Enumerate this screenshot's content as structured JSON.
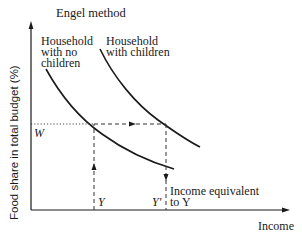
{
  "diagram": {
    "title": "Engel method",
    "y_axis_label": "Food share in total budget (%)",
    "x_axis_label": "Income",
    "curves": [
      {
        "id": "no-children",
        "label_lines": [
          "Household",
          "with no",
          "children"
        ]
      },
      {
        "id": "with-children",
        "label_lines": [
          "Household",
          "with children"
        ]
      }
    ],
    "markers": {
      "w_label": "W",
      "y_label": "Y",
      "y_prime_label": "Y'",
      "equivalent_label_lines": [
        "Income equivalent",
        "to Y"
      ]
    }
  }
}
